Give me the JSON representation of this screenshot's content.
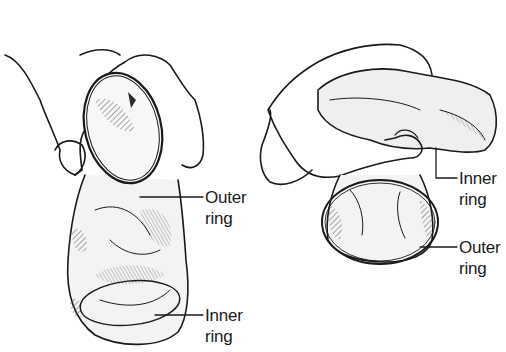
{
  "figure": {
    "colors": {
      "ink": "#1a1a1a",
      "shade": "#8a8a8a",
      "background": "#ffffff"
    }
  },
  "panels": [
    {
      "id": "left",
      "labels": [
        {
          "line1": "Outer",
          "line2": "ring"
        },
        {
          "line1": "Inner",
          "line2": "ring"
        }
      ]
    },
    {
      "id": "right",
      "labels": [
        {
          "line1": "Inner",
          "line2": "ring"
        },
        {
          "line1": "Outer",
          "line2": "ring"
        }
      ]
    }
  ]
}
